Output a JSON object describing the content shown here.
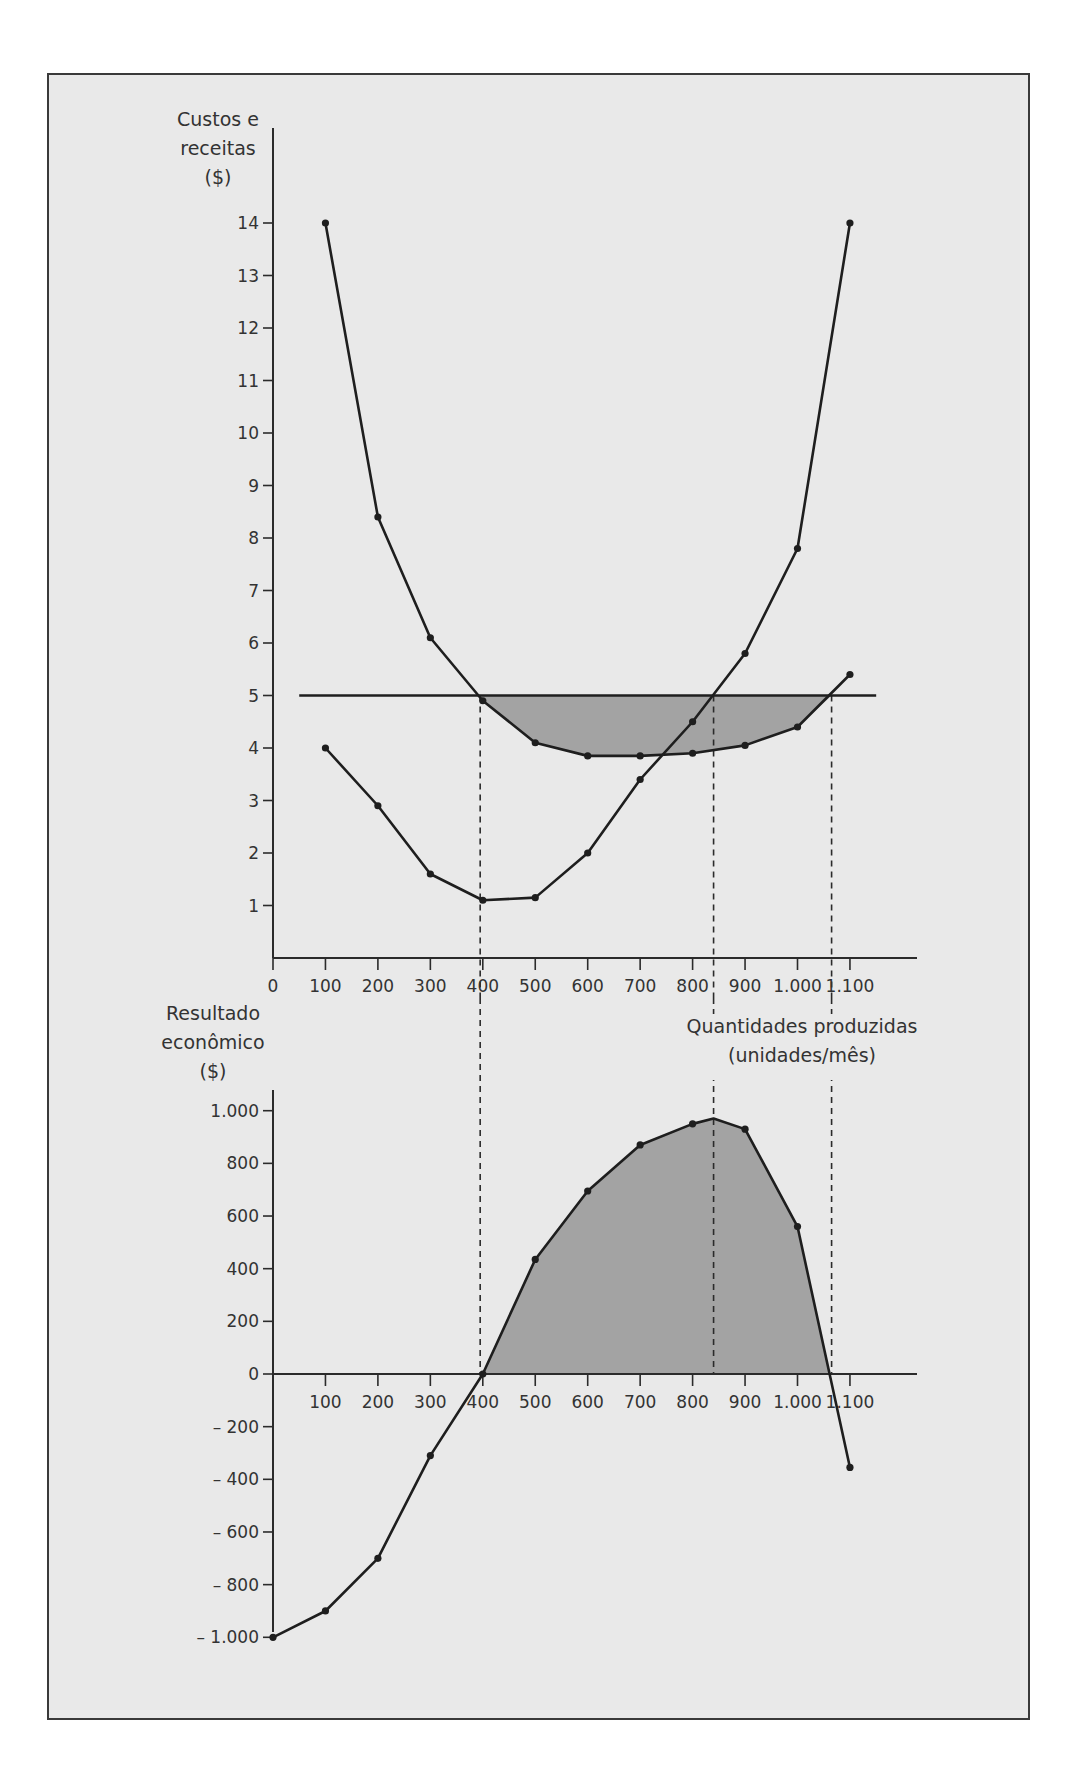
{
  "chart_data": [
    {
      "type": "line",
      "title": "",
      "ylabel_lines": [
        "Custos e",
        "receitas",
        "($)"
      ],
      "xlabel": "",
      "xlim": [
        0,
        1150
      ],
      "ylim": [
        0,
        15
      ],
      "x_ticks": [
        0,
        100,
        200,
        300,
        400,
        500,
        600,
        700,
        800,
        900,
        1000,
        1100
      ],
      "x_tick_labels": [
        "0",
        "100",
        "200",
        "300",
        "400",
        "500",
        "600",
        "700",
        "800",
        "900",
        "1.000",
        "1.100"
      ],
      "y_ticks": [
        1,
        2,
        3,
        4,
        5,
        6,
        7,
        8,
        9,
        10,
        11,
        12,
        13,
        14
      ],
      "y_tick_labels": [
        "1",
        "2",
        "3",
        "4",
        "5",
        "6",
        "7",
        "8",
        "9",
        "10",
        "11",
        "12",
        "13",
        "14"
      ],
      "x": [
        100,
        200,
        300,
        400,
        500,
        600,
        700,
        800,
        900,
        1000,
        1100
      ],
      "series": [
        {
          "name": "Custo médio total",
          "values": [
            14,
            8.4,
            6.1,
            4.9,
            4.1,
            3.85,
            3.85,
            3.9,
            4.05,
            4.4,
            5.4
          ]
        },
        {
          "name": "Custo marginal",
          "values": [
            4,
            2.9,
            1.6,
            1.1,
            1.15,
            2.0,
            3.4,
            4.5,
            5.8,
            7.8,
            14
          ]
        },
        {
          "name": "Preço (receita marginal)",
          "constant": 5,
          "x_range": [
            50,
            1150
          ]
        }
      ],
      "shaded_region": {
        "between": [
          "Preço (receita marginal)",
          "Custo médio total"
        ],
        "x_range": [
          395,
          1065
        ]
      },
      "vertical_dashed_lines_x": [
        395,
        840,
        1065
      ],
      "grid": false,
      "legend": "none"
    },
    {
      "type": "area",
      "title": "",
      "ylabel_lines": [
        "Resultado",
        "econômico",
        "($)"
      ],
      "xlabel_lines": [
        "Quantidades produzidas",
        "(unidades/mês)"
      ],
      "xlim": [
        0,
        1150
      ],
      "ylim": [
        -1100,
        1100
      ],
      "x_ticks": [
        100,
        200,
        300,
        400,
        500,
        600,
        700,
        800,
        900,
        1000,
        1100
      ],
      "x_tick_labels": [
        "100",
        "200",
        "300",
        "400",
        "500",
        "600",
        "700",
        "800",
        "900",
        "1.000",
        "1.100"
      ],
      "y_ticks": [
        1000,
        800,
        600,
        400,
        200,
        0,
        -200,
        -400,
        -600,
        -800,
        -1000
      ],
      "y_tick_labels": [
        "1.000",
        "800",
        "600",
        "400",
        "200",
        "0",
        "– 200",
        "– 400",
        "– 600",
        "– 800",
        "– 1.000"
      ],
      "x": [
        0,
        100,
        200,
        300,
        400,
        500,
        600,
        700,
        800,
        840,
        900,
        1000,
        1100
      ],
      "series": [
        {
          "name": "Resultado econômico",
          "values": [
            -1000,
            -900,
            -700,
            -310,
            0,
            435,
            695,
            870,
            950,
            970,
            930,
            560,
            -355
          ]
        }
      ],
      "shaded_region": {
        "where": "values > 0",
        "x_range": [
          400,
          1062
        ]
      },
      "vertical_dashed_lines_x": [
        395,
        840,
        1065
      ],
      "grid": false,
      "legend": "none"
    }
  ]
}
